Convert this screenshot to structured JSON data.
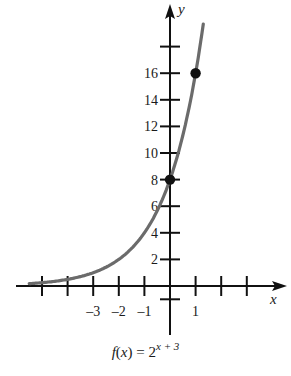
{
  "chart_data": {
    "type": "line",
    "function": "2^(x+3)",
    "xlabel": "x",
    "ylabel": "y",
    "xlim": [
      -5.2,
      4.2
    ],
    "ylim": [
      -3,
      20
    ],
    "x_tick_labels": [
      "-3",
      "-2",
      "-1",
      "1"
    ],
    "x_ticks": [
      -5,
      -4,
      -3,
      -2,
      -1,
      1,
      2,
      3
    ],
    "y_tick_labels": [
      "2",
      "4",
      "6",
      "8",
      "10",
      "12",
      "14",
      "16"
    ],
    "y_ticks": [
      -1,
      2,
      4,
      6,
      8,
      10,
      12,
      14,
      16,
      18
    ],
    "grid": false,
    "curve_color": "#6b6b6b",
    "points": [
      {
        "x": 0,
        "y": 8
      },
      {
        "x": 1,
        "y": 16
      }
    ],
    "series": [
      {
        "name": "f(x) = 2^(x+3)",
        "x": [
          -5,
          -4,
          -3,
          -2,
          -1,
          0,
          1,
          1.3
        ],
        "values": [
          0.25,
          0.5,
          1,
          2,
          4,
          8,
          16,
          19.7
        ]
      }
    ]
  },
  "labels": {
    "x_axis": "x",
    "y_axis": "y",
    "caption_prefix": "f(x) = 2",
    "caption_exponent": "x + 3"
  }
}
